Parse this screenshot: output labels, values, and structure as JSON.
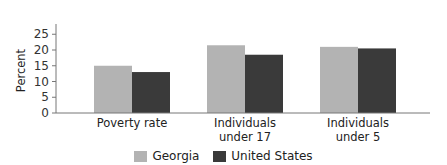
{
  "chart_data": {
    "type": "bar",
    "title": "",
    "xlabel": "",
    "ylabel": "Percent",
    "ylim": [
      0,
      28
    ],
    "yticks": [
      0,
      5,
      10,
      15,
      20,
      25
    ],
    "grid": false,
    "legend_position": "bottom",
    "categories": [
      "Poverty rate",
      "Individuals under 17",
      "Individuals under 5"
    ],
    "category_lines": [
      [
        "Poverty rate"
      ],
      [
        "Individuals",
        "under 17"
      ],
      [
        "Individuals",
        "under 5"
      ]
    ],
    "series": [
      {
        "name": "Georgia",
        "color": "#b3b3b3",
        "values": [
          15,
          21.5,
          21
        ]
      },
      {
        "name": "United States",
        "color": "#3a3a3a",
        "values": [
          13,
          18.5,
          20.5
        ]
      }
    ]
  },
  "legend": {
    "items": [
      {
        "label": "Georgia",
        "color": "#b3b3b3"
      },
      {
        "label": "United States",
        "color": "#3a3a3a"
      }
    ]
  }
}
